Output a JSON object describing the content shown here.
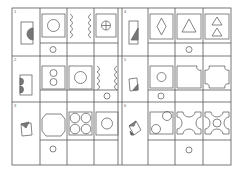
{
  "colors": {
    "line": "#555555",
    "shape": "#666666",
    "fill": "#777777",
    "bg": "#ffffff"
  },
  "problems": [
    {
      "number": "1",
      "key_shape": "rect-with-half-disc",
      "options": [
        "square-circle",
        "wavy-brackets",
        "circle-cross"
      ],
      "answer_index": 0
    },
    {
      "number": "4",
      "key_shape": "rect-with-triangle",
      "options": [
        "square-diamond",
        "square-triangle",
        "square-two-triangles"
      ],
      "answer_index": 1
    },
    {
      "number": "2",
      "key_shape": "rect-with-two-half-discs",
      "options": [
        "square-two-circles",
        "square-circle",
        "wavy-brackets"
      ],
      "answer_index": 2
    },
    {
      "number": "5",
      "key_shape": "folded-square",
      "options": [
        "square-circle",
        "square-notched-corner",
        "octagon-notched"
      ],
      "answer_index": 0
    },
    {
      "number": "3",
      "key_shape": "folded-square-dark",
      "options": [
        "octagon",
        "four-circles",
        "square-circle"
      ],
      "answer_index": 0
    },
    {
      "number": "6",
      "key_shape": "folded-square-shaded",
      "options": [
        "square-two-circles",
        "x-shape-concave",
        "x-shape-circle"
      ],
      "answer_index": 1
    }
  ]
}
